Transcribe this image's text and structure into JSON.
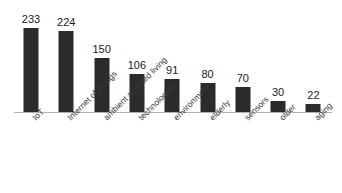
{
  "chart_data": {
    "type": "bar",
    "title": "",
    "subtitle": "",
    "xlabel": "",
    "ylabel": "",
    "grid": false,
    "legend": false,
    "axis_line": true,
    "ylim": [
      0,
      233
    ],
    "orientation": "vertical",
    "bar_color": "#2b2b2b",
    "axis_color": "#b3b3b3",
    "background_color": "#ffffff",
    "label_rotation_deg": -45,
    "value_labels_shown": true,
    "categories": [
      "IoT",
      "Internet of Things",
      "ambient assisted living",
      "technologies",
      "environment",
      "elderly",
      "sensors",
      "older",
      "aging"
    ],
    "values": [
      233,
      224,
      150,
      106,
      91,
      80,
      70,
      30,
      22
    ],
    "value_labels": [
      "233",
      "224",
      "150",
      "106",
      "91",
      "80",
      "70",
      "30",
      "22"
    ]
  }
}
